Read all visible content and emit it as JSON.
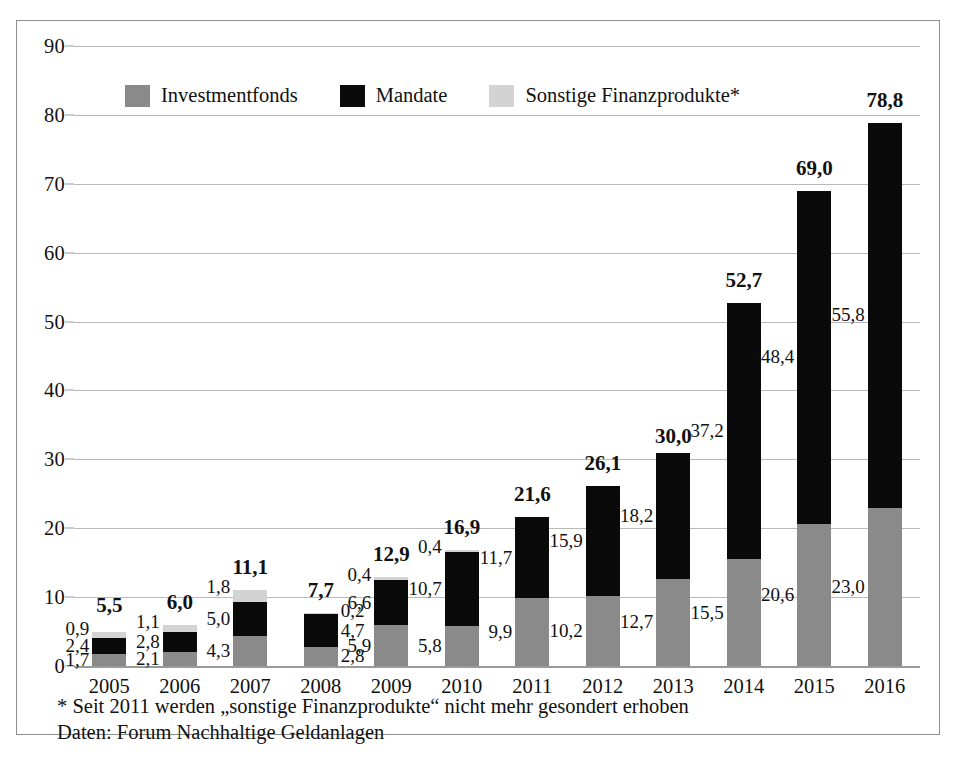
{
  "legend": {
    "items": [
      {
        "label": "Investmentfonds",
        "color": "#8a8a8a",
        "key": "fonds"
      },
      {
        "label": "Mandate",
        "color": "#0a0a0a",
        "key": "mandate"
      },
      {
        "label": "Sonstige Finanzprodukte*",
        "color": "#d3d3d3",
        "key": "sonstige"
      }
    ]
  },
  "footnotes": {
    "line1": "* Seit 2011 werden „sonstige Finanzprodukte“ nicht mehr gesondert erhoben",
    "line2": "Daten: Forum Nachhaltige Geldanlagen"
  },
  "chart_data": {
    "type": "bar",
    "title": "",
    "subtitle": "",
    "xlabel": "",
    "ylabel": "",
    "ylim": [
      0,
      90
    ],
    "yticks": [
      0,
      10,
      20,
      30,
      40,
      50,
      60,
      70,
      80,
      90
    ],
    "ytick_labels": [
      "0",
      "10",
      "20",
      "30",
      "40",
      "50",
      "60",
      "70",
      "80",
      "90"
    ],
    "grid": true,
    "stacked": true,
    "legend_position": "top-left-inside",
    "categories": [
      "2005",
      "2006",
      "2007",
      "2008",
      "2009",
      "2010",
      "2011",
      "2012",
      "2013",
      "2014",
      "2015",
      "2016"
    ],
    "series": [
      {
        "name": "Investmentfonds",
        "color": "#8a8a8a",
        "values": [
          1.7,
          2.1,
          4.3,
          2.8,
          5.9,
          5.8,
          9.9,
          10.2,
          12.7,
          15.5,
          20.6,
          23.0
        ],
        "labels": [
          "1,7",
          "2,1",
          "4,3",
          "2,8",
          "5,9",
          "5,8",
          "9,9",
          "10,2",
          "12,7",
          "15,5",
          "20,6",
          "23,0"
        ]
      },
      {
        "name": "Mandate",
        "color": "#0a0a0a",
        "values": [
          2.4,
          2.8,
          5.0,
          4.7,
          6.6,
          10.7,
          11.7,
          15.9,
          18.2,
          37.2,
          48.4,
          55.8
        ],
        "labels": [
          "2,4",
          "2,8",
          "5,0",
          "4,7",
          "6,6",
          "10,7",
          "11,7",
          "15,9",
          "18,2",
          "37,2",
          "48,4",
          "55,8"
        ]
      },
      {
        "name": "Sonstige Finanzprodukte*",
        "color": "#d3d3d3",
        "values": [
          0.9,
          1.1,
          1.8,
          0.2,
          0.4,
          0.4,
          0,
          0,
          0,
          0,
          0,
          0
        ],
        "labels": [
          "0,9",
          "1,1",
          "1,8",
          "0,2",
          "0,4",
          "0,4",
          "",
          "",
          "",
          "",
          "",
          ""
        ]
      }
    ],
    "totals": [
      5.5,
      6.0,
      11.1,
      7.7,
      12.9,
      16.9,
      21.6,
      26.1,
      30.0,
      52.7,
      69.0,
      78.8
    ],
    "total_labels": [
      "5,5",
      "6,0",
      "11,1",
      "7,7",
      "12,9",
      "16,9",
      "21,6",
      "26,1",
      "30,0",
      "52,7",
      "69,0",
      "78,8"
    ],
    "label_sides": [
      "left",
      "left",
      "left",
      "right",
      "left",
      "left",
      "left",
      "left",
      "left",
      "left",
      "left",
      "left"
    ]
  }
}
